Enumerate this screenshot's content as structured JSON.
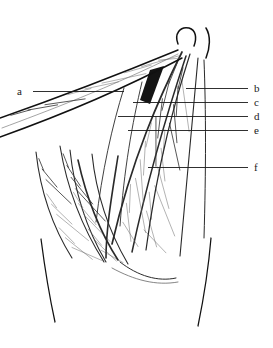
{
  "figure": {
    "type": "anatomical-line-illustration",
    "background_color": "#ffffff",
    "ink_color": "#111111",
    "width": 273,
    "height": 348
  },
  "labels": [
    {
      "id": "a",
      "text": "a",
      "side": "left",
      "text_x": 22,
      "text_y": 92,
      "line_x1": 33,
      "line_x2": 124,
      "line_y": 91
    },
    {
      "id": "b",
      "text": "b",
      "side": "right",
      "text_x": 254,
      "text_y": 89,
      "line_x1": 186,
      "line_x2": 248,
      "line_y": 88
    },
    {
      "id": "c",
      "text": "c",
      "side": "right",
      "text_x": 254,
      "text_y": 103,
      "line_x1": 133,
      "line_x2": 248,
      "line_y": 102
    },
    {
      "id": "d",
      "text": "d",
      "side": "right",
      "text_x": 254,
      "text_y": 117,
      "line_x1": 118,
      "line_x2": 248,
      "line_y": 116
    },
    {
      "id": "e",
      "text": "e",
      "side": "right",
      "text_x": 254,
      "text_y": 131,
      "line_x1": 128,
      "line_x2": 248,
      "line_y": 130
    },
    {
      "id": "f",
      "text": "f",
      "side": "right",
      "text_x": 254,
      "text_y": 168,
      "line_x1": 148,
      "line_x2": 248,
      "line_y": 167
    }
  ],
  "strokes": {
    "limb_outline_left": "M 41 239 C 44 262 48 290 55 322",
    "limb_outline_right": "M 211 238 C 209 262 205 292 198 326",
    "hip_curve_outer": "M 178 44 C 174 34 180 26 189 28 C 196 30 197 38 194 46",
    "hip_curve_inner": "M 206 28 C 211 36 210 48 206 58",
    "sartorius_upper": "M 0 118 C 40 104 110 78 178 50",
    "sartorius_lower": "M 0 137 C 42 122 112 95 182 58",
    "sartorius_mid": "M 2 128 C 42 113 112 87 178 54",
    "tfl_band_left": "M 182 52 C 160 96 132 158 112 244",
    "tfl_band_right": "M 190 54 C 176 98 158 160 146 250",
    "rectus_left": "M 186 56 C 170 104 150 168 132 252",
    "rectus_right": "M 198 58 C 194 108 188 170 180 256",
    "vastus_med_left": "M 60 146 C 66 182 80 224 104 262",
    "vastus_med_right": "M 92 154 C 96 192 108 230 128 264",
    "adductor_left": "M 36 152 C 40 188 52 226 72 258",
    "adductor_right": "M 70 150 C 74 188 86 228 106 262",
    "lateral_edge": "M 204 60 C 206 110 206 170 204 238",
    "inner_fold_1": "M 124 88 C 112 126 102 172 96 222",
    "inner_fold_2": "M 142 82 C 132 124 124 170 120 226",
    "deep_shadow_wedge": "M 150 70 L 164 66 L 150 104 L 140 100 Z",
    "inner_v_left": "M 78 160 C 86 196 100 232 118 260",
    "inner_v_right": "M 118 156 C 112 194 106 228 106 258",
    "lower_muscle_tip": "M 120 262 C 138 276 158 282 176 278",
    "bottom_fringe": "M 112 268 C 134 280 156 286 178 282"
  },
  "striation_groups": {
    "sartorius_count": 9,
    "tfl_count": 11,
    "rectus_count": 12,
    "vastus_count": 10,
    "adductor_count": 9
  }
}
